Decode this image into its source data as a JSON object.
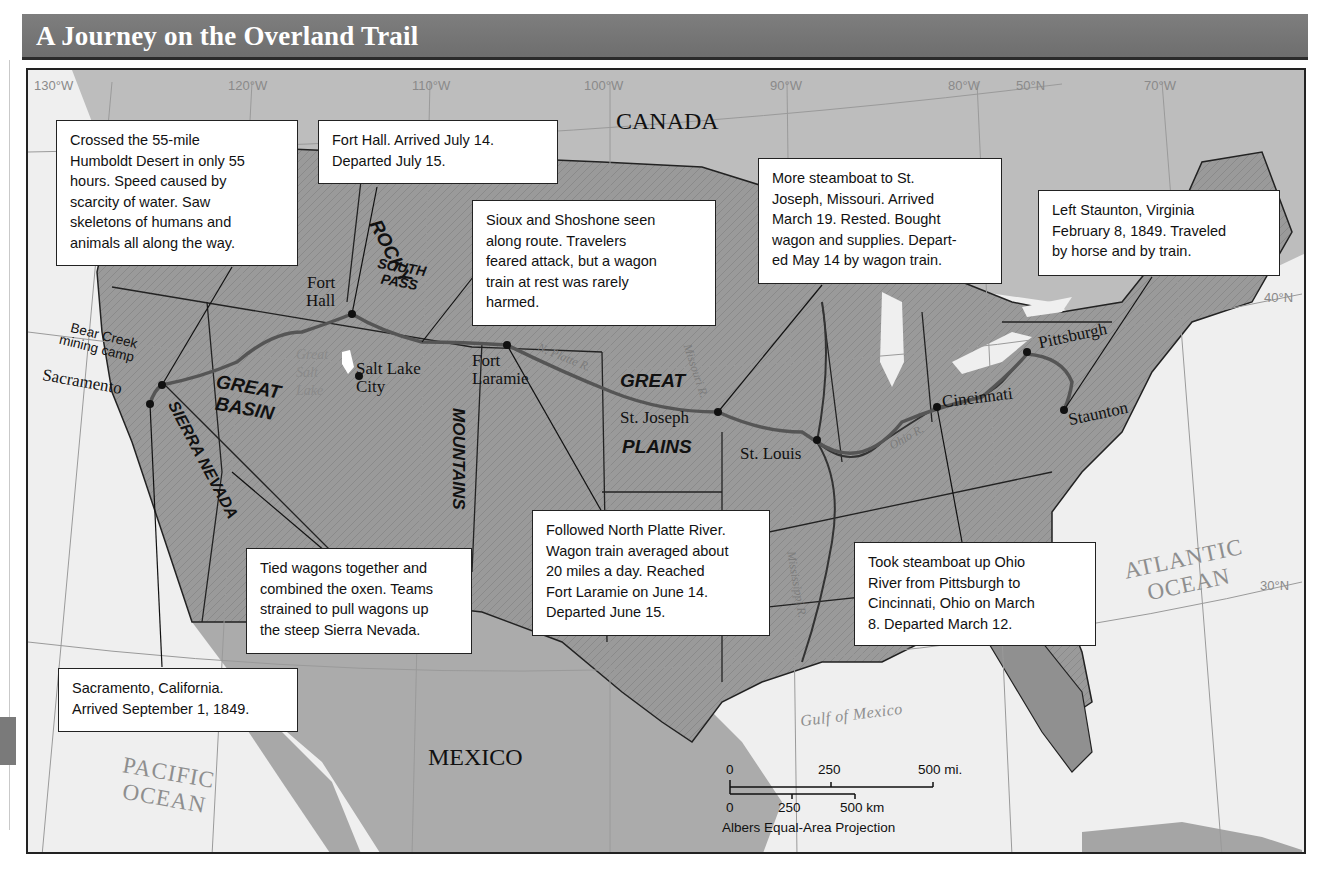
{
  "title": "A Journey on the Overland Trail",
  "colors": {
    "title_bar": "#737373",
    "land_us": "#8f8f8f",
    "land_other": "#b9b9b9",
    "water": "#efefef",
    "route": "#5e5e5e",
    "callout_bg": "#ffffff"
  },
  "grid": {
    "longitudes": [
      "130°W",
      "120°W",
      "110°W",
      "100°W",
      "90°W",
      "80°W",
      "70°W"
    ],
    "latitudes": [
      "50°N",
      "40°N",
      "30°N"
    ]
  },
  "countries": [
    "CANADA",
    "MEXICO"
  ],
  "oceans": {
    "pacific": [
      "PACIFIC",
      "OCEAN"
    ],
    "atlantic": [
      "ATLANTIC",
      "OCEAN"
    ],
    "gulf": "Gulf of Mexico"
  },
  "regions": {
    "rocky": "ROCKY",
    "mountains": "MOUNTAINS",
    "south_pass": [
      "SOUTH",
      "PASS"
    ],
    "great_basin": [
      "GREAT",
      "BASIN"
    ],
    "sierra_nevada": "SIERRA NEVADA",
    "great_plains": [
      "GREAT",
      "PLAINS"
    ]
  },
  "rivers": {
    "north_platte": "N. Platte R.",
    "missouri": "Missouri R.",
    "ohio": "Ohio R.",
    "mississippi": "Mississippi R.",
    "great_salt_lake": [
      "Great",
      "Salt",
      "Lake"
    ]
  },
  "places": [
    {
      "id": "sacramento",
      "name": "Sacramento"
    },
    {
      "id": "bear-creek",
      "name": "Bear Creek mining camp",
      "lines": [
        "Bear Creek",
        "mining camp"
      ]
    },
    {
      "id": "fort-hall",
      "name": "Fort Hall",
      "lines": [
        "Fort",
        "Hall"
      ]
    },
    {
      "id": "salt-lake-city",
      "name": "Salt Lake City",
      "lines": [
        "Salt Lake",
        "City"
      ]
    },
    {
      "id": "fort-laramie",
      "name": "Fort Laramie",
      "lines": [
        "Fort",
        "Laramie"
      ]
    },
    {
      "id": "st-joseph",
      "name": "St. Joseph"
    },
    {
      "id": "st-louis",
      "name": "St. Louis"
    },
    {
      "id": "cincinnati",
      "name": "Cincinnati"
    },
    {
      "id": "pittsburgh",
      "name": "Pittsburgh"
    },
    {
      "id": "staunton",
      "name": "Staunton"
    }
  ],
  "callouts": [
    {
      "id": "humboldt",
      "text": "Crossed the 55-mile\nHumboldt Desert in only 55\nhours.  Speed caused by\nscarcity of water.  Saw\nskeletons of humans and\nanimals all along the way."
    },
    {
      "id": "fort-hall",
      "text": "Fort Hall.  Arrived July 14.\nDeparted July 15."
    },
    {
      "id": "sioux",
      "text": "Sioux and Shoshone seen\nalong route.  Travelers\nfeared attack, but a wagon\ntrain at rest was rarely\nharmed."
    },
    {
      "id": "st-joseph",
      "text": "More steamboat to St.\nJoseph, Missouri.  Arrived\nMarch 19.  Rested.  Bought\nwagon and supplies.  Depart-\ned May 14 by wagon train."
    },
    {
      "id": "staunton",
      "text": "Left Staunton, Virginia\nFebruary 8, 1849.  Traveled\nby horse and by train."
    },
    {
      "id": "sierra",
      "text": "Tied wagons together and\ncombined the oxen.  Teams\nstrained to pull wagons up\nthe steep Sierra Nevada."
    },
    {
      "id": "platte",
      "text": "Followed North Platte River.\nWagon train averaged about\n20 miles a day.  Reached\nFort Laramie on June 14.\nDeparted June 15."
    },
    {
      "id": "ohio",
      "text": "Took steamboat up Ohio\nRiver from Pittsburgh to\nCincinnati, Ohio on March\n8.  Departed March 12."
    },
    {
      "id": "sacramento",
      "text": "Sacramento, California.\nArrived September 1, 1849."
    }
  ],
  "scale_bar": {
    "miles": {
      "ticks": [
        "0",
        "250",
        "500 mi."
      ]
    },
    "km": {
      "ticks": [
        "0",
        "250",
        "500 km"
      ]
    },
    "projection": "Albers Equal-Area Projection"
  }
}
